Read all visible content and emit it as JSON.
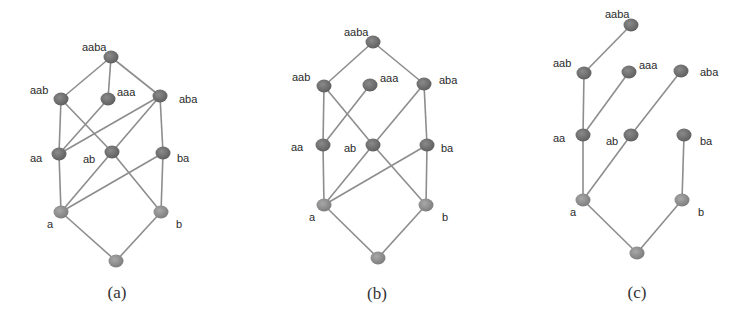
{
  "colors": {
    "edge": "#8d8d8d",
    "node_upper": "#6f6f6f",
    "node_lower": "#8e8e8e",
    "label": "#2a2a2a",
    "caption": "#333333"
  },
  "panels": [
    {
      "id": "a",
      "caption": "(a)",
      "caption_pos": [
        117,
        298
      ],
      "nodes": [
        {
          "id": "aaba",
          "label": "aaba",
          "x": 111,
          "y": 57,
          "lx": 82,
          "ly": 51,
          "tone": "upper"
        },
        {
          "id": "aab",
          "label": "aab",
          "x": 61,
          "y": 99,
          "lx": 30,
          "ly": 94,
          "tone": "upper"
        },
        {
          "id": "aaa",
          "label": "aaa",
          "x": 108,
          "y": 99,
          "lx": 117,
          "ly": 96,
          "tone": "upper"
        },
        {
          "id": "aba",
          "label": "aba",
          "x": 160,
          "y": 96,
          "lx": 179,
          "ly": 103,
          "tone": "upper"
        },
        {
          "id": "aa",
          "label": "aa",
          "x": 59,
          "y": 154,
          "lx": 30,
          "ly": 162,
          "tone": "upper"
        },
        {
          "id": "ab",
          "label": "ab",
          "x": 112,
          "y": 152,
          "lx": 83,
          "ly": 163,
          "tone": "upper"
        },
        {
          "id": "ba",
          "label": "ba",
          "x": 163,
          "y": 153,
          "lx": 177,
          "ly": 162,
          "tone": "upper"
        },
        {
          "id": "a",
          "label": "a",
          "x": 61,
          "y": 212,
          "lx": 47,
          "ly": 228,
          "tone": "lower"
        },
        {
          "id": "b",
          "label": "b",
          "x": 161,
          "y": 212,
          "lx": 176,
          "ly": 228,
          "tone": "lower"
        },
        {
          "id": "eps",
          "label": "",
          "x": 116,
          "y": 261,
          "lx": 0,
          "ly": 0,
          "tone": "lower"
        }
      ],
      "edges": [
        [
          "aaba",
          "aab"
        ],
        [
          "aaba",
          "aaa"
        ],
        [
          "aaba",
          "aba"
        ],
        [
          "aab",
          "aa"
        ],
        [
          "aab",
          "ab"
        ],
        [
          "aaa",
          "aa"
        ],
        [
          "aba",
          "aa"
        ],
        [
          "aba",
          "ab"
        ],
        [
          "aba",
          "ba"
        ],
        [
          "aa",
          "a"
        ],
        [
          "ab",
          "a"
        ],
        [
          "ab",
          "b"
        ],
        [
          "ba",
          "a"
        ],
        [
          "ba",
          "b"
        ],
        [
          "a",
          "eps"
        ],
        [
          "b",
          "eps"
        ]
      ]
    },
    {
      "id": "b",
      "caption": "(b)",
      "caption_pos": [
        377,
        299
      ],
      "nodes": [
        {
          "id": "aaba",
          "label": "aaba",
          "x": 373,
          "y": 42,
          "lx": 344,
          "ly": 36,
          "tone": "upper"
        },
        {
          "id": "aab",
          "label": "aab",
          "x": 324,
          "y": 86,
          "lx": 292,
          "ly": 81,
          "tone": "upper"
        },
        {
          "id": "aaa",
          "label": "aaa",
          "x": 370,
          "y": 85,
          "lx": 380,
          "ly": 82,
          "tone": "upper"
        },
        {
          "id": "aba",
          "label": "aba",
          "x": 424,
          "y": 84,
          "lx": 439,
          "ly": 84,
          "tone": "upper"
        },
        {
          "id": "aa",
          "label": "aa",
          "x": 323,
          "y": 145,
          "lx": 291,
          "ly": 151,
          "tone": "upper"
        },
        {
          "id": "ab",
          "label": "ab",
          "x": 373,
          "y": 145,
          "lx": 344,
          "ly": 152,
          "tone": "upper"
        },
        {
          "id": "ba",
          "label": "ba",
          "x": 427,
          "y": 145,
          "lx": 441,
          "ly": 152,
          "tone": "upper"
        },
        {
          "id": "a",
          "label": "a",
          "x": 324,
          "y": 205,
          "lx": 309,
          "ly": 221,
          "tone": "lower"
        },
        {
          "id": "b",
          "label": "b",
          "x": 426,
          "y": 205,
          "lx": 442,
          "ly": 221,
          "tone": "lower"
        },
        {
          "id": "eps",
          "label": "",
          "x": 378,
          "y": 258,
          "lx": 0,
          "ly": 0,
          "tone": "lower"
        }
      ],
      "edges": [
        [
          "aaba",
          "aab"
        ],
        [
          "aaba",
          "aba"
        ],
        [
          "aab",
          "aa"
        ],
        [
          "aab",
          "ab"
        ],
        [
          "aaa",
          "aa"
        ],
        [
          "aba",
          "ab"
        ],
        [
          "aba",
          "ba"
        ],
        [
          "aa",
          "a"
        ],
        [
          "ab",
          "a"
        ],
        [
          "ab",
          "b"
        ],
        [
          "ba",
          "a"
        ],
        [
          "ba",
          "b"
        ],
        [
          "a",
          "eps"
        ],
        [
          "b",
          "eps"
        ]
      ]
    },
    {
      "id": "c",
      "caption": "(c)",
      "caption_pos": [
        637,
        298
      ],
      "nodes": [
        {
          "id": "aaba",
          "label": "aaba",
          "x": 631,
          "y": 25,
          "lx": 605,
          "ly": 18,
          "tone": "upper"
        },
        {
          "id": "aab",
          "label": "aab",
          "x": 584,
          "y": 73,
          "lx": 553,
          "ly": 67,
          "tone": "upper"
        },
        {
          "id": "aaa",
          "label": "aaa",
          "x": 629,
          "y": 72,
          "lx": 639,
          "ly": 69,
          "tone": "upper"
        },
        {
          "id": "aba",
          "label": "aba",
          "x": 681,
          "y": 71,
          "lx": 700,
          "ly": 76,
          "tone": "upper"
        },
        {
          "id": "aa",
          "label": "aa",
          "x": 583,
          "y": 135,
          "lx": 553,
          "ly": 142,
          "tone": "upper"
        },
        {
          "id": "ab",
          "label": "ab",
          "x": 631,
          "y": 135,
          "lx": 606,
          "ly": 145,
          "tone": "upper"
        },
        {
          "id": "ba",
          "label": "ba",
          "x": 684,
          "y": 135,
          "lx": 700,
          "ly": 145,
          "tone": "upper"
        },
        {
          "id": "a",
          "label": "a",
          "x": 583,
          "y": 200,
          "lx": 570,
          "ly": 216,
          "tone": "lower"
        },
        {
          "id": "b",
          "label": "b",
          "x": 682,
          "y": 200,
          "lx": 698,
          "ly": 216,
          "tone": "lower"
        },
        {
          "id": "eps",
          "label": "",
          "x": 637,
          "y": 253,
          "lx": 0,
          "ly": 0,
          "tone": "lower"
        }
      ],
      "edges": [
        [
          "aaba",
          "aab"
        ],
        [
          "aab",
          "aa"
        ],
        [
          "aaa",
          "aa"
        ],
        [
          "aba",
          "ab"
        ],
        [
          "aa",
          "a"
        ],
        [
          "ab",
          "a"
        ],
        [
          "ba",
          "b"
        ],
        [
          "a",
          "eps"
        ],
        [
          "b",
          "eps"
        ]
      ]
    }
  ]
}
